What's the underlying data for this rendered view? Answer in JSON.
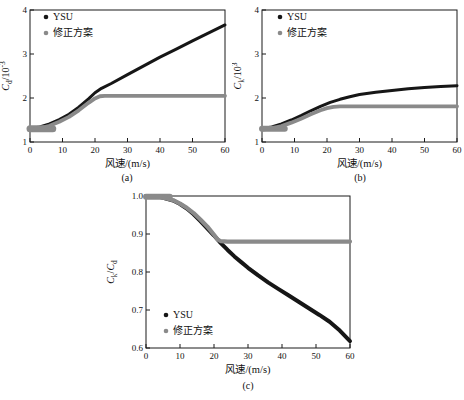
{
  "figure_title": "",
  "colors": {
    "ysu": "#161616",
    "corrected": "#8a8a8a",
    "axis": "#1a1a1a",
    "text": "#111111",
    "background": "#ffffff"
  },
  "chart_data": [
    {
      "type": "scatter",
      "caption": "(a)",
      "xlabel": "风速/(m/s)",
      "ylabel": "Cd/10^-3",
      "ylabel_parts": [
        {
          "t": "C",
          "it": true
        },
        {
          "t": "d",
          "pos": "sub"
        },
        {
          "t": "/10"
        },
        {
          "t": "-3",
          "pos": "sup"
        }
      ],
      "xlim": [
        0,
        60
      ],
      "ylim": [
        1,
        4
      ],
      "xticks": [
        0,
        10,
        20,
        30,
        40,
        50,
        60
      ],
      "xtick_labels": [
        "0",
        "10",
        "20",
        "30",
        "40",
        "50",
        "60"
      ],
      "yticks": [
        1,
        2,
        3,
        4
      ],
      "ytick_labels": [
        "1",
        "2",
        "3",
        "4"
      ],
      "grid": false,
      "legend_position": "top-left",
      "legend": [
        "YSU",
        "修正方案"
      ],
      "series": [
        {
          "name": "YSU",
          "color": "ysu",
          "width": 3,
          "points": [
            [
              0,
              1.3
            ],
            [
              3,
              1.34
            ],
            [
              6,
              1.41
            ],
            [
              9,
              1.51
            ],
            [
              12,
              1.63
            ],
            [
              15,
              1.79
            ],
            [
              18,
              1.98
            ],
            [
              20,
              2.12
            ],
            [
              22,
              2.22
            ],
            [
              25,
              2.33
            ],
            [
              30,
              2.53
            ],
            [
              35,
              2.73
            ],
            [
              40,
              2.93
            ],
            [
              45,
              3.11
            ],
            [
              50,
              3.3
            ],
            [
              55,
              3.48
            ],
            [
              60,
              3.66
            ]
          ]
        },
        {
          "name": "修正方案",
          "color": "corrected",
          "width": 3.8,
          "points": [
            [
              0,
              1.28
            ],
            [
              3,
              1.31
            ],
            [
              6,
              1.37
            ],
            [
              9,
              1.46
            ],
            [
              12,
              1.57
            ],
            [
              15,
              1.72
            ],
            [
              18,
              1.89
            ],
            [
              20,
              1.99
            ],
            [
              21.5,
              2.04
            ],
            [
              23,
              2.05
            ],
            [
              60,
              2.05
            ]
          ],
          "extra": {
            "width": 7,
            "points": [
              [
                0,
                1.3
              ],
              [
                7,
                1.3
              ]
            ]
          }
        }
      ],
      "layout": {
        "w": 232,
        "h": 170,
        "ml": 30,
        "mt": 8,
        "mr": 7,
        "mb": 30,
        "ylx": 9,
        "legend": {
          "x": 46,
          "y": 18,
          "dy": 16
        }
      }
    },
    {
      "type": "scatter",
      "caption": "(b)",
      "xlabel": "风速/(m/s)",
      "ylabel": "Ck/10^3",
      "ylabel_parts": [
        {
          "t": "C",
          "it": true
        },
        {
          "t": "k",
          "pos": "sub"
        },
        {
          "t": "/10"
        },
        {
          "t": "3",
          "pos": "sup"
        }
      ],
      "xlim": [
        0,
        60
      ],
      "ylim": [
        1,
        4
      ],
      "xticks": [
        0,
        10,
        20,
        30,
        40,
        50,
        60
      ],
      "xtick_labels": [
        "0",
        "10",
        "20",
        "30",
        "40",
        "50",
        "60"
      ],
      "yticks": [
        1,
        2,
        3,
        4
      ],
      "ytick_labels": [
        "1",
        "2",
        "3",
        "4"
      ],
      "grid": false,
      "legend_position": "top-left",
      "legend": [
        "YSU",
        "修正方案"
      ],
      "series": [
        {
          "name": "YSU",
          "color": "ysu",
          "width": 3,
          "points": [
            [
              0,
              1.3
            ],
            [
              3,
              1.34
            ],
            [
              6,
              1.41
            ],
            [
              9,
              1.5
            ],
            [
              12,
              1.6
            ],
            [
              15,
              1.71
            ],
            [
              18,
              1.81
            ],
            [
              21,
              1.9
            ],
            [
              24,
              1.97
            ],
            [
              27,
              2.03
            ],
            [
              30,
              2.08
            ],
            [
              35,
              2.13
            ],
            [
              40,
              2.17
            ],
            [
              45,
              2.21
            ],
            [
              50,
              2.24
            ],
            [
              55,
              2.26
            ],
            [
              60,
              2.28
            ]
          ]
        },
        {
          "name": "修正方案",
          "color": "corrected",
          "width": 3.8,
          "points": [
            [
              0,
              1.28
            ],
            [
              3,
              1.31
            ],
            [
              6,
              1.36
            ],
            [
              9,
              1.44
            ],
            [
              12,
              1.53
            ],
            [
              15,
              1.63
            ],
            [
              18,
              1.72
            ],
            [
              20,
              1.77
            ],
            [
              22,
              1.8
            ],
            [
              24,
              1.81
            ],
            [
              60,
              1.81
            ]
          ],
          "extra": {
            "width": 6,
            "points": [
              [
                0,
                1.3
              ],
              [
                7,
                1.3
              ]
            ]
          }
        }
      ],
      "layout": {
        "w": 232,
        "h": 170,
        "ml": 30,
        "mt": 8,
        "mr": 7,
        "mb": 30,
        "ylx": 9,
        "legend": {
          "x": 48,
          "y": 18,
          "dy": 16
        }
      }
    },
    {
      "type": "scatter",
      "caption": "(c)",
      "xlabel": "风速/(m/s)",
      "ylabel": "Ck/Cd",
      "ylabel_parts": [
        {
          "t": "C",
          "it": true
        },
        {
          "t": "k",
          "pos": "sub"
        },
        {
          "t": "/"
        },
        {
          "t": "C",
          "it": true
        },
        {
          "t": "d",
          "pos": "sub"
        }
      ],
      "xlim": [
        0,
        60
      ],
      "ylim": [
        0.6,
        1.0
      ],
      "xticks": [
        0,
        10,
        20,
        30,
        40,
        50,
        60
      ],
      "xtick_labels": [
        "0",
        "10",
        "20",
        "30",
        "40",
        "50",
        "60"
      ],
      "yticks": [
        0.6,
        0.7,
        0.8,
        0.9,
        1.0
      ],
      "ytick_labels": [
        "0.6",
        "0.7",
        "0.8",
        "0.9",
        "1.0"
      ],
      "grid": false,
      "legend_position": "bottom-left",
      "legend": [
        "YSU",
        "修正方案"
      ],
      "series": [
        {
          "name": "YSU",
          "color": "ysu",
          "width": 4,
          "points": [
            [
              0,
              1.0
            ],
            [
              4,
              0.998
            ],
            [
              8,
              0.988
            ],
            [
              10,
              0.979
            ],
            [
              12,
              0.967
            ],
            [
              14,
              0.952
            ],
            [
              16,
              0.934
            ],
            [
              18,
              0.915
            ],
            [
              20,
              0.896
            ],
            [
              22,
              0.876
            ],
            [
              24,
              0.858
            ],
            [
              26,
              0.841
            ],
            [
              28,
              0.826
            ],
            [
              30,
              0.811
            ],
            [
              33,
              0.791
            ],
            [
              36,
              0.772
            ],
            [
              39,
              0.755
            ],
            [
              42,
              0.738
            ],
            [
              45,
              0.721
            ],
            [
              48,
              0.704
            ],
            [
              51,
              0.687
            ],
            [
              54,
              0.669
            ],
            [
              57,
              0.646
            ],
            [
              60,
              0.618
            ]
          ]
        },
        {
          "name": "修正方案",
          "color": "corrected",
          "width": 4.2,
          "points": [
            [
              0,
              1.0
            ],
            [
              4,
              0.998
            ],
            [
              8,
              0.989
            ],
            [
              10,
              0.98
            ],
            [
              12,
              0.969
            ],
            [
              14,
              0.955
            ],
            [
              16,
              0.938
            ],
            [
              18,
              0.92
            ],
            [
              20,
              0.898
            ],
            [
              21,
              0.886
            ],
            [
              22,
              0.881
            ],
            [
              24,
              0.88
            ],
            [
              60,
              0.88
            ]
          ],
          "extra": {
            "width": 6,
            "points": [
              [
                0,
                0.998
              ],
              [
                7,
                0.998
              ]
            ]
          }
        }
      ],
      "layout": {
        "w": 260,
        "h": 190,
        "ml": 46,
        "mt": 6,
        "mr": 10,
        "mb": 32,
        "ylx": 14,
        "legend": {
          "x": 66,
          "y": 128,
          "dy": 16
        }
      }
    }
  ]
}
